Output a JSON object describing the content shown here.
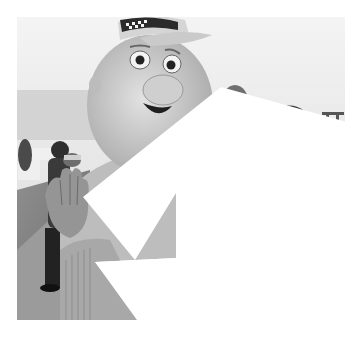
{
  "image": {
    "description": "Grayscale photograph of a person in a large cartoon mascot costume (round face, big nose, smiling mouth, checkered-band cap) waving a gloved hand at an outdoor fair; a crowd and white tents at left, and a metal arch structure at right. Large white polygonal areas are cut out of the photo.",
    "mode": "grayscale",
    "colors": {
      "background": "#ffffff",
      "sky": "#e6e6e6",
      "mascot_face": "#cfcfcf",
      "dark_areas": "#2e2e2e",
      "ground": "#8a8a8a"
    }
  }
}
